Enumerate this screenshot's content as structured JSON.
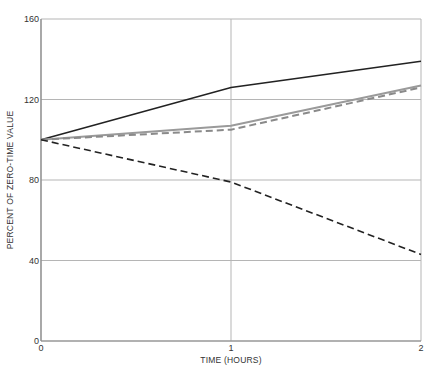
{
  "chart_data": {
    "type": "line",
    "title": "",
    "xlabel": "TIME (HOURS)",
    "ylabel": "PERCENT OF ZERO-TIME VALUE",
    "x": [
      0,
      1,
      2
    ],
    "xlim": [
      0,
      2
    ],
    "ylim": [
      0,
      160
    ],
    "xticks": [
      "0",
      "1",
      "2"
    ],
    "yticks": [
      "0",
      "40",
      "80",
      "120",
      "160"
    ],
    "grid": true,
    "legend": null,
    "series": [
      {
        "name": "solid-black",
        "style": "solid",
        "color": "#222222",
        "values": [
          100,
          126,
          139
        ]
      },
      {
        "name": "solid-gray",
        "style": "solid",
        "color": "#9a9a9a",
        "values": [
          100,
          107,
          127
        ]
      },
      {
        "name": "dashed-gray",
        "style": "dashed",
        "color": "#8a8a8a",
        "values": [
          100,
          105,
          126
        ]
      },
      {
        "name": "dashed-black",
        "style": "dashed",
        "color": "#222222",
        "values": [
          100,
          79,
          43
        ]
      }
    ]
  },
  "axes": {
    "x_title": "TIME (HOURS)",
    "y_title": "PERCENT OF ZERO-TIME VALUE",
    "x_ticks": [
      "0",
      "1",
      "2"
    ],
    "y_ticks": [
      "0",
      "40",
      "80",
      "120",
      "160"
    ]
  }
}
